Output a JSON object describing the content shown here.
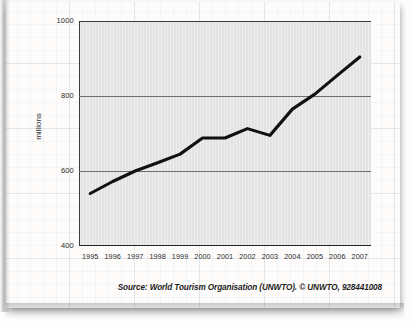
{
  "figure": {
    "y_axis_title": "millions",
    "source_note": "Source: World Tourism Organisation (UNWTO). © UNWTO, 928441008"
  },
  "chart_data": {
    "type": "line",
    "title": "",
    "xlabel": "",
    "ylabel": "millions",
    "categories": [
      "1995",
      "1996",
      "1997",
      "1998",
      "1999",
      "2000",
      "2001",
      "2002",
      "2003",
      "2004",
      "2005",
      "2006",
      "2007"
    ],
    "values": [
      540,
      572,
      600,
      622,
      645,
      688,
      688,
      713,
      695,
      765,
      805,
      855,
      904
    ],
    "series": [
      {
        "name": "International tourist arrivals",
        "values": [
          540,
          572,
          600,
          622,
          645,
          688,
          688,
          713,
          695,
          765,
          805,
          855,
          904
        ]
      }
    ],
    "ylim": [
      400,
      1000
    ],
    "yticks": [
      400,
      600,
      800,
      1000
    ],
    "ytick_labels": [
      "400",
      "600",
      "800",
      "1000"
    ],
    "xtick_labels": [
      "1995",
      "1996",
      "1997",
      "1998",
      "1999",
      "2000",
      "2001",
      "2002",
      "2003",
      "2004",
      "2005",
      "2006",
      "2007"
    ],
    "grid": "horizontal",
    "legend": "none",
    "line_color": "#111111",
    "plot_background": "#e3e3e3",
    "page_background": "#fdfcfb"
  }
}
